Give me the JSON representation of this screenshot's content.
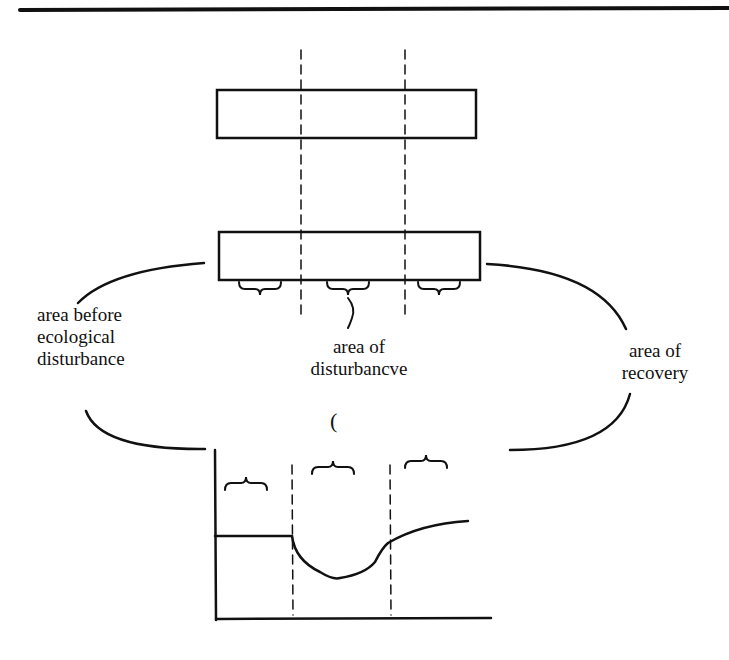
{
  "diagram": {
    "labels": {
      "before": [
        "area before",
        "ecological",
        "disturbance"
      ],
      "disturbance": [
        "area of",
        "disturbancve"
      ],
      "recovery": [
        "area of",
        "recovery"
      ]
    },
    "stray_glyph": "(",
    "colors": {
      "ink": "#111111",
      "background": "#ffffff"
    }
  }
}
